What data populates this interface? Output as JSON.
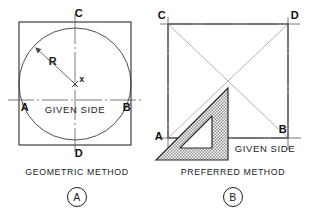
{
  "figure": {
    "background_color": "#ffffff",
    "ink_color": "#1c1c1c",
    "construction_line_color": "#8a8a8a",
    "hatch_color": "#9b9b9b"
  },
  "panel_a": {
    "id": "A",
    "caption": "GEOMETRIC METHOD",
    "badge_label": "A",
    "side_label": "GIVEN SIDE",
    "radius_label": "R",
    "center_label": "x",
    "vertices": [
      {
        "name": "A",
        "label": "A",
        "x": 19,
        "y": 100
      },
      {
        "name": "B",
        "label": "B",
        "x": 131,
        "y": 100
      },
      {
        "name": "C",
        "label": "C",
        "x": 75,
        "y": 22
      },
      {
        "name": "D",
        "label": "D",
        "x": 75,
        "y": 145
      }
    ],
    "square": {
      "left": 19,
      "top": 22,
      "right": 131,
      "bottom": 145
    },
    "circle": {
      "cx": 75,
      "cy": 84,
      "r": 56
    },
    "given_side_line": {
      "x1": 8,
      "y1": 100,
      "x2": 143,
      "y2": 100
    }
  },
  "panel_b": {
    "id": "B",
    "caption": "PREFERRED METHOD",
    "badge_label": "B",
    "side_label": "GIVEN SIDE",
    "vertices": [
      {
        "name": "A",
        "label": "A",
        "x": 168,
        "y": 138
      },
      {
        "name": "B",
        "label": "B",
        "x": 288,
        "y": 138
      },
      {
        "name": "C",
        "label": "C",
        "x": 168,
        "y": 24
      },
      {
        "name": "D",
        "label": "D",
        "x": 288,
        "y": 24
      }
    ],
    "square": {
      "left": 168,
      "top": 24,
      "right": 288,
      "bottom": 138
    },
    "diagonals": [
      {
        "from": "C",
        "to": "B"
      },
      {
        "from": "A",
        "to": "D"
      }
    ],
    "given_side_line": {
      "x1": 157,
      "y1": 138,
      "x2": 302,
      "y2": 138
    },
    "set_square": {
      "name": "45-degree-set-square",
      "outer_points": "156,160 228,88 228,160",
      "inner_points": "180,148 212,116 212,148"
    }
  }
}
